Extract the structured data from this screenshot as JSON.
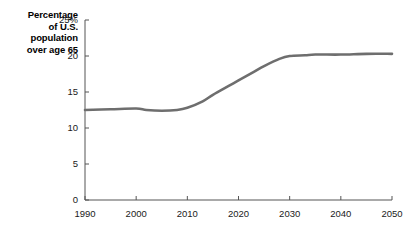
{
  "chart_data": {
    "type": "line",
    "title": "",
    "subtitle": "",
    "xlabel": "",
    "ylabel": "Percentage of U.S. population over age 65",
    "ylabel_lines": [
      "Percentage",
      "of U.S.",
      "population",
      "over age 65"
    ],
    "xlim": [
      1990,
      2050
    ],
    "ylim": [
      0,
      25
    ],
    "grid": false,
    "legend": false,
    "legend_position": "none",
    "line_color": "#6e6e6e",
    "line_width": 2.6,
    "axis_color": "#555555",
    "x_ticks": [
      1990,
      2000,
      2010,
      2020,
      2030,
      2040,
      2050
    ],
    "x_tick_labels": [
      "1990",
      "2000",
      "2010",
      "2020",
      "2030",
      "2040",
      "2050"
    ],
    "y_ticks": [
      0,
      5,
      10,
      15,
      20,
      25
    ],
    "y_tick_labels": [
      "0",
      "5",
      "10",
      "15",
      "20",
      "25%"
    ],
    "series": [
      {
        "name": "Percentage of U.S. population over age 65",
        "x": [
          1990,
          1995,
          2000,
          2002,
          2005,
          2008,
          2010,
          2013,
          2015,
          2018,
          2020,
          2023,
          2025,
          2028,
          2030,
          2033,
          2035,
          2040,
          2045,
          2050
        ],
        "values": [
          12.5,
          12.6,
          12.7,
          12.5,
          12.4,
          12.5,
          12.8,
          13.7,
          14.6,
          15.8,
          16.6,
          17.8,
          18.6,
          19.6,
          20.0,
          20.1,
          20.2,
          20.2,
          20.3,
          20.3
        ]
      }
    ]
  },
  "plot_geometry": {
    "left": 85,
    "right": 392,
    "top": 20,
    "bottom": 200
  }
}
